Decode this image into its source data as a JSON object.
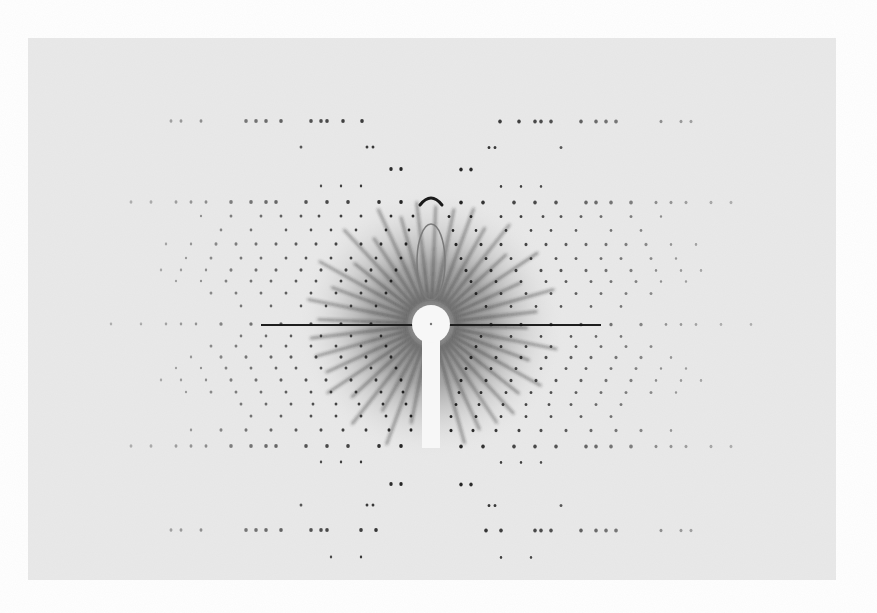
{
  "image": {
    "subject": "X-ray fiber diffraction photograph",
    "width": 877,
    "height": 613,
    "background": "#ffffff",
    "film": {
      "x": 28,
      "y": 38,
      "w": 808,
      "h": 542,
      "color": "#e9e9e9"
    },
    "center": {
      "x": 431,
      "y": 324
    },
    "beamstop": {
      "radius": 19,
      "stem_width": 18,
      "stem_bottom": 448,
      "color": "#f7f7f7"
    },
    "halo": {
      "radius": 135,
      "inner_color": "#6a6a6a",
      "outer_color": "#e9e9e9"
    },
    "equator": {
      "half_length": 170,
      "thickness": 2,
      "color": "#1e1e1e"
    },
    "streaks": {
      "count": 40,
      "inner": 24,
      "outer": 128,
      "color": "#2a2a2a"
    },
    "arc": {
      "y": 201,
      "width": 22,
      "color": "#1a1a1a"
    },
    "ellipse": {
      "cx": 431,
      "cy": 262,
      "rx": 14,
      "ry": 38,
      "color": "#7a7a7a"
    },
    "spot_color": "#151515",
    "layer_lines": [
      {
        "dy": -203,
        "offsets": [
          69,
          88,
          104,
          110,
          120,
          150,
          165,
          175,
          185,
          230,
          250,
          260
        ],
        "r": 1.8
      },
      {
        "dy": -177,
        "offsets": [
          58,
          64,
          130
        ],
        "r": 1.4
      },
      {
        "dy": -155,
        "offsets": [
          30,
          40
        ],
        "r": 1.7
      },
      {
        "dy": -138,
        "offsets": [
          70,
          90,
          110
        ],
        "r": 1.2
      },
      {
        "dy": -122,
        "offsets": [
          30,
          52,
          83,
          104,
          125,
          155,
          165,
          180,
          200,
          225,
          240,
          255,
          280,
          300
        ],
        "r": 1.8
      },
      {
        "dy": -108,
        "offsets": [
          18,
          40,
          70,
          90,
          112,
          130,
          150,
          170,
          200,
          230
        ],
        "r": 1.4
      },
      {
        "dy": -94,
        "offsets": [
          22,
          45,
          75,
          100,
          120,
          145,
          180,
          210
        ],
        "r": 1.3
      },
      {
        "dy": -80,
        "offsets": [
          25,
          50,
          70,
          95,
          115,
          135,
          155,
          175,
          195,
          215,
          240,
          265
        ],
        "r": 1.5
      },
      {
        "dy": -66,
        "offsets": [
          30,
          55,
          80,
          100,
          125,
          145,
          170,
          190,
          220,
          245
        ],
        "r": 1.4
      },
      {
        "dy": -54,
        "offsets": [
          35,
          60,
          85,
          110,
          130,
          155,
          175,
          200,
          225,
          250,
          270
        ],
        "r": 1.5
      },
      {
        "dy": -43,
        "offsets": [
          40,
          65,
          90,
          115,
          135,
          160,
          180,
          205,
          230,
          255
        ],
        "r": 1.4
      },
      {
        "dy": -31,
        "offsets": [
          45,
          70,
          95,
          120,
          145,
          170,
          195,
          220
        ],
        "r": 1.4
      },
      {
        "dy": -18,
        "offsets": [
          55,
          80,
          105,
          130,
          160,
          190
        ],
        "r": 1.3
      },
      {
        "dy": 0,
        "offsets": [
          60,
          90,
          120,
          150,
          180,
          210,
          235,
          250,
          265,
          290,
          320
        ],
        "r": 1.6
      },
      {
        "dy": 12,
        "offsets": [
          50,
          80,
          110,
          140,
          165,
          190
        ],
        "r": 1.3
      },
      {
        "dy": 22,
        "offsets": [
          45,
          70,
          95,
          120,
          145,
          170,
          195,
          220
        ],
        "r": 1.4
      },
      {
        "dy": 33,
        "offsets": [
          40,
          65,
          90,
          115,
          140,
          160,
          185,
          210,
          240
        ],
        "r": 1.5
      },
      {
        "dy": 44,
        "offsets": [
          35,
          60,
          85,
          110,
          135,
          155,
          180,
          205,
          230,
          255
        ],
        "r": 1.4
      },
      {
        "dy": 56,
        "offsets": [
          30,
          55,
          80,
          105,
          125,
          150,
          175,
          200,
          225,
          250,
          270
        ],
        "r": 1.5
      },
      {
        "dy": 68,
        "offsets": [
          28,
          50,
          75,
          100,
          120,
          145,
          170,
          195,
          220,
          245
        ],
        "r": 1.4
      },
      {
        "dy": 80,
        "offsets": [
          25,
          48,
          72,
          95,
          118,
          140,
          165,
          190
        ],
        "r": 1.4
      },
      {
        "dy": 92,
        "offsets": [
          20,
          45,
          70,
          95,
          120,
          150,
          180
        ],
        "r": 1.4
      },
      {
        "dy": 106,
        "offsets": [
          20,
          42,
          65,
          88,
          110,
          135,
          160,
          185,
          210,
          240
        ],
        "r": 1.5
      },
      {
        "dy": 122,
        "offsets": [
          30,
          52,
          83,
          104,
          125,
          155,
          165,
          180,
          200,
          225,
          240,
          255,
          280,
          300
        ],
        "r": 1.8
      },
      {
        "dy": 138,
        "offsets": [
          70,
          90,
          110
        ],
        "r": 1.2
      },
      {
        "dy": 160,
        "offsets": [
          30,
          40
        ],
        "r": 1.7
      },
      {
        "dy": 181,
        "offsets": [
          58,
          64,
          130
        ],
        "r": 1.4
      },
      {
        "dy": 206,
        "offsets": [
          55,
          70,
          104,
          110,
          120,
          150,
          165,
          175,
          185,
          230,
          250,
          260
        ],
        "r": 1.8
      },
      {
        "dy": 233,
        "offsets": [
          70,
          100
        ],
        "r": 1.2
      }
    ]
  }
}
